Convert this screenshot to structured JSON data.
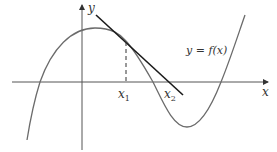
{
  "diagram": {
    "type": "function-graph-with-tangent",
    "labels": {
      "x_axis": "x",
      "y_axis": "y",
      "curve": "y = f(x)",
      "point1_base": "x",
      "point1_sub": "1",
      "point2_base": "x",
      "point2_sub": "2"
    },
    "colors": {
      "curve": "#6b6b6b",
      "tangent": "#1a1a1a",
      "axes": "#555555",
      "dashed": "#333333",
      "text": "#333333"
    }
  }
}
